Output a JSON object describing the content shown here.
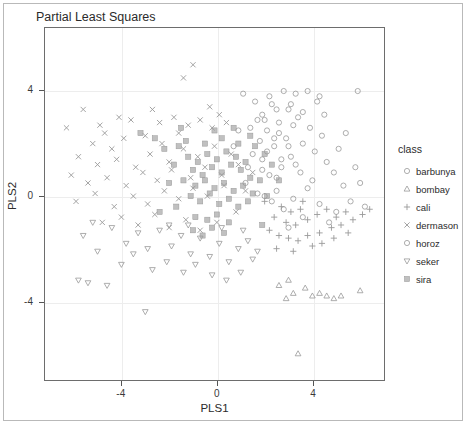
{
  "chart_data": {
    "type": "scatter",
    "title": "Partial Least Squares",
    "xlabel": "PLS1",
    "ylabel": "PLS2",
    "xlim": [
      -7.2,
      7.0
    ],
    "ylim": [
      -7.0,
      6.4
    ],
    "xticks": [
      -4,
      0,
      4
    ],
    "xticklabels": [
      "-4",
      "0",
      "4"
    ],
    "yticks": [
      -4,
      0,
      4
    ],
    "yticklabels": [
      "-4",
      "0",
      "4"
    ],
    "grid": true,
    "grid_color": "#ededed",
    "legend_title": "class",
    "legend_position": "right",
    "marker_color": "#999999",
    "series": [
      {
        "name": "barbunya",
        "marker": "circle",
        "points": [
          [
            3.0,
            3.3
          ],
          [
            3.4,
            3.0
          ],
          [
            2.6,
            2.8
          ],
          [
            3.9,
            2.6
          ],
          [
            4.4,
            2.3
          ],
          [
            2.9,
            2.2
          ],
          [
            3.6,
            2.0
          ],
          [
            4.1,
            1.7
          ],
          [
            2.4,
            1.9
          ],
          [
            3.1,
            1.5
          ],
          [
            4.6,
            1.3
          ],
          [
            2.7,
            1.1
          ],
          [
            3.5,
            0.9
          ],
          [
            4.0,
            0.6
          ],
          [
            2.2,
            0.8
          ],
          [
            3.8,
            0.3
          ],
          [
            4.9,
            0.9
          ],
          [
            5.3,
            0.4
          ],
          [
            2.5,
            0.2
          ],
          [
            3.2,
            -0.1
          ],
          [
            4.3,
            -0.3
          ],
          [
            5.0,
            -0.6
          ],
          [
            2.8,
            -0.5
          ],
          [
            3.6,
            -0.8
          ],
          [
            4.7,
            -1.0
          ],
          [
            5.6,
            -0.2
          ],
          [
            6.0,
            0.5
          ],
          [
            2.1,
            2.5
          ],
          [
            1.9,
            1.4
          ],
          [
            4.2,
            3.6
          ],
          [
            3.3,
            3.9
          ],
          [
            5.1,
            1.8
          ],
          [
            5.8,
            1.1
          ],
          [
            2.3,
            3.5
          ],
          [
            1.7,
            2.9
          ],
          [
            4.5,
            3.1
          ],
          [
            5.4,
            2.4
          ],
          [
            6.2,
            -0.4
          ],
          [
            2.0,
            0.0
          ],
          [
            3.0,
            -1.2
          ]
        ]
      },
      {
        "name": "bombay",
        "marker": "triangle-up",
        "points": [
          [
            2.6,
            -3.4
          ],
          [
            3.2,
            -3.7
          ],
          [
            3.7,
            -3.5
          ],
          [
            4.0,
            -3.8
          ],
          [
            4.3,
            -3.7
          ],
          [
            4.6,
            -3.8
          ],
          [
            5.2,
            -3.8
          ],
          [
            6.0,
            -3.6
          ],
          [
            3.4,
            -6.0
          ],
          [
            2.9,
            -3.9
          ],
          [
            4.9,
            -3.9
          ],
          [
            3.0,
            -3.2
          ]
        ]
      },
      {
        "name": "cali",
        "marker": "plus",
        "points": [
          [
            2.7,
            -0.4
          ],
          [
            3.1,
            -0.6
          ],
          [
            3.5,
            -0.5
          ],
          [
            2.4,
            -0.8
          ],
          [
            2.9,
            -1.0
          ],
          [
            3.3,
            -1.1
          ],
          [
            3.8,
            -0.9
          ],
          [
            4.2,
            -0.7
          ],
          [
            4.6,
            -0.5
          ],
          [
            5.0,
            -0.8
          ],
          [
            5.4,
            -0.6
          ],
          [
            2.2,
            -1.3
          ],
          [
            2.6,
            -1.5
          ],
          [
            3.0,
            -1.6
          ],
          [
            3.4,
            -1.7
          ],
          [
            3.8,
            -1.5
          ],
          [
            4.3,
            -1.4
          ],
          [
            4.8,
            -1.2
          ],
          [
            5.2,
            -1.1
          ],
          [
            5.7,
            -0.9
          ],
          [
            2.0,
            -0.2
          ],
          [
            3.6,
            -0.2
          ],
          [
            4.0,
            -1.9
          ],
          [
            4.4,
            -1.8
          ],
          [
            6.1,
            -0.7
          ],
          [
            2.5,
            -2.0
          ],
          [
            3.2,
            -2.1
          ],
          [
            4.9,
            -1.6
          ],
          [
            5.5,
            -1.4
          ],
          [
            6.4,
            -0.5
          ]
        ]
      },
      {
        "name": "dermason",
        "marker": "x",
        "points": [
          [
            -1.0,
            5.0
          ],
          [
            -1.4,
            4.5
          ],
          [
            -5.6,
            3.3
          ],
          [
            -4.9,
            2.7
          ],
          [
            -4.7,
            2.4
          ],
          [
            -3.6,
            2.9
          ],
          [
            -5.2,
            2.0
          ],
          [
            -4.4,
            1.8
          ],
          [
            -3.0,
            2.3
          ],
          [
            -2.4,
            2.8
          ],
          [
            -1.8,
            3.0
          ],
          [
            -1.2,
            2.7
          ],
          [
            -0.7,
            2.9
          ],
          [
            -0.2,
            2.6
          ],
          [
            0.4,
            2.8
          ],
          [
            -5.8,
            1.5
          ],
          [
            -5.0,
            1.2
          ],
          [
            -4.2,
            1.4
          ],
          [
            -3.4,
            1.1
          ],
          [
            -2.8,
            1.6
          ],
          [
            -2.0,
            1.3
          ],
          [
            -1.4,
            1.8
          ],
          [
            -0.8,
            1.5
          ],
          [
            -0.1,
            1.9
          ],
          [
            0.6,
            1.6
          ],
          [
            -6.1,
            0.8
          ],
          [
            -5.4,
            0.5
          ],
          [
            -4.6,
            0.7
          ],
          [
            -3.8,
            0.4
          ],
          [
            -3.1,
            0.9
          ],
          [
            -2.5,
            0.6
          ],
          [
            -1.9,
            1.0
          ],
          [
            -1.1,
            0.7
          ],
          [
            -0.5,
            1.1
          ],
          [
            0.2,
            0.8
          ],
          [
            -5.9,
            -0.2
          ],
          [
            -5.1,
            0.1
          ],
          [
            -4.3,
            -0.4
          ],
          [
            -3.5,
            0.0
          ],
          [
            -2.9,
            -0.3
          ],
          [
            -2.2,
            0.2
          ],
          [
            -1.6,
            -0.1
          ],
          [
            -1.0,
            0.3
          ],
          [
            -0.4,
            0.0
          ],
          [
            0.3,
            0.4
          ],
          [
            -4.8,
            -1.0
          ],
          [
            -4.0,
            -0.8
          ],
          [
            -3.3,
            -1.1
          ],
          [
            -2.6,
            -0.7
          ],
          [
            -2.0,
            -1.2
          ],
          [
            -1.3,
            -0.9
          ],
          [
            -0.7,
            -1.3
          ],
          [
            0.0,
            -1.0
          ],
          [
            0.8,
            -0.6
          ],
          [
            1.2,
            0.2
          ],
          [
            -2.3,
            2.0
          ],
          [
            -3.9,
            2.2
          ],
          [
            -1.6,
            2.4
          ],
          [
            0.9,
            1.2
          ],
          [
            1.5,
            0.9
          ],
          [
            -6.3,
            2.6
          ],
          [
            -0.3,
            3.4
          ],
          [
            0.1,
            3.1
          ],
          [
            -2.7,
            3.3
          ],
          [
            -4.1,
            3.0
          ]
        ]
      },
      {
        "name": "horoz",
        "marker": "circle",
        "points": [
          [
            1.6,
            3.6
          ],
          [
            2.2,
            3.8
          ],
          [
            2.8,
            4.0
          ],
          [
            1.9,
            3.1
          ],
          [
            2.5,
            3.3
          ],
          [
            3.1,
            3.5
          ],
          [
            1.4,
            2.6
          ],
          [
            2.0,
            2.9
          ],
          [
            2.6,
            2.4
          ],
          [
            3.2,
            2.7
          ],
          [
            1.8,
            2.1
          ],
          [
            2.4,
            2.2
          ],
          [
            3.0,
            1.9
          ],
          [
            1.5,
            1.6
          ],
          [
            2.1,
            1.7
          ],
          [
            2.7,
            1.4
          ],
          [
            3.3,
            1.2
          ],
          [
            1.3,
            1.1
          ],
          [
            1.9,
            1.0
          ],
          [
            2.5,
            0.7
          ],
          [
            3.8,
            4.0
          ],
          [
            4.3,
            3.8
          ],
          [
            1.1,
            3.9
          ],
          [
            0.9,
            2.5
          ],
          [
            3.6,
            3.2
          ],
          [
            5.9,
            4.0
          ],
          [
            1.2,
            0.5
          ],
          [
            1.7,
            0.1
          ],
          [
            2.3,
            -0.2
          ],
          [
            0.7,
            1.9
          ]
        ]
      },
      {
        "name": "seker",
        "marker": "triangle-down",
        "points": [
          [
            -5.6,
            -1.5
          ],
          [
            -5.0,
            -2.1
          ],
          [
            -5.8,
            -3.2
          ],
          [
            -5.4,
            -3.3
          ],
          [
            -4.4,
            -1.2
          ],
          [
            -3.8,
            -1.8
          ],
          [
            -3.3,
            -1.4
          ],
          [
            -2.9,
            -2.0
          ],
          [
            -2.4,
            -1.3
          ],
          [
            -1.9,
            -1.9
          ],
          [
            -1.5,
            -1.5
          ],
          [
            -1.1,
            -2.2
          ],
          [
            -0.7,
            -1.6
          ],
          [
            -0.3,
            -2.3
          ],
          [
            0.1,
            -1.8
          ],
          [
            0.5,
            -2.5
          ],
          [
            0.9,
            -2.0
          ],
          [
            1.3,
            -1.7
          ],
          [
            -4.0,
            -2.6
          ],
          [
            -3.5,
            -2.2
          ],
          [
            -2.7,
            -2.8
          ],
          [
            -2.1,
            -2.5
          ],
          [
            -1.4,
            -2.9
          ],
          [
            -0.9,
            -2.6
          ],
          [
            -0.2,
            -3.0
          ],
          [
            0.4,
            -3.2
          ],
          [
            1.0,
            -2.9
          ],
          [
            1.5,
            -2.4
          ],
          [
            -3.0,
            -4.4
          ],
          [
            -4.6,
            -3.4
          ],
          [
            -2.0,
            -1.1
          ],
          [
            -1.2,
            -1.1
          ],
          [
            0.2,
            -1.2
          ],
          [
            1.1,
            -1.3
          ],
          [
            -5.2,
            -1.0
          ],
          [
            1.7,
            -2.1
          ]
        ]
      },
      {
        "name": "sira",
        "marker": "square-filled",
        "points": [
          [
            -1.2,
            1.5
          ],
          [
            -0.8,
            1.3
          ],
          [
            -0.4,
            1.6
          ],
          [
            0.0,
            1.4
          ],
          [
            0.4,
            1.7
          ],
          [
            0.8,
            1.5
          ],
          [
            1.2,
            1.3
          ],
          [
            -1.0,
            1.0
          ],
          [
            -0.6,
            0.8
          ],
          [
            -0.2,
            1.1
          ],
          [
            0.2,
            0.9
          ],
          [
            0.6,
            1.2
          ],
          [
            1.0,
            1.0
          ],
          [
            1.4,
            0.7
          ],
          [
            -1.4,
            0.6
          ],
          [
            -0.9,
            0.4
          ],
          [
            -0.5,
            0.6
          ],
          [
            -0.1,
            0.3
          ],
          [
            0.3,
            0.5
          ],
          [
            0.7,
            0.2
          ],
          [
            1.1,
            0.4
          ],
          [
            1.5,
            0.1
          ],
          [
            -1.1,
            0.0
          ],
          [
            -0.7,
            -0.2
          ],
          [
            -0.3,
            0.1
          ],
          [
            0.1,
            -0.3
          ],
          [
            0.5,
            -0.1
          ],
          [
            0.9,
            -0.4
          ],
          [
            1.3,
            -0.2
          ],
          [
            -1.6,
            1.9
          ],
          [
            -1.3,
            2.1
          ],
          [
            -0.5,
            2.0
          ],
          [
            0.2,
            2.2
          ],
          [
            0.9,
            2.0
          ],
          [
            1.6,
            1.9
          ],
          [
            -0.9,
            -0.8
          ],
          [
            -0.4,
            -0.9
          ],
          [
            0.0,
            -0.7
          ],
          [
            0.5,
            -1.0
          ],
          [
            -1.0,
            -1.3
          ],
          [
            -0.6,
            -1.5
          ],
          [
            -0.2,
            -1.2
          ],
          [
            0.3,
            -1.4
          ],
          [
            2.0,
            1.6
          ],
          [
            2.3,
            1.2
          ],
          [
            -2.2,
            1.8
          ],
          [
            -1.8,
            1.2
          ],
          [
            -2.0,
            0.5
          ],
          [
            1.8,
            0.6
          ],
          [
            2.1,
            0.0
          ],
          [
            -1.7,
            -0.4
          ],
          [
            1.9,
            -1.1
          ],
          [
            -3.2,
            2.4
          ],
          [
            -2.6,
            2.2
          ],
          [
            2.6,
            0.6
          ],
          [
            -2.4,
            -0.6
          ],
          [
            0.7,
            2.6
          ],
          [
            -0.1,
            2.5
          ],
          [
            1.4,
            2.3
          ],
          [
            -1.5,
            2.6
          ]
        ]
      }
    ]
  },
  "legend": {
    "title": "class",
    "items": [
      {
        "label": "barbunya",
        "glyph": "circle-icon"
      },
      {
        "label": "bombay",
        "glyph": "triangle-up-icon"
      },
      {
        "label": "cali",
        "glyph": "plus-icon"
      },
      {
        "label": "dermason",
        "glyph": "x-mark-icon"
      },
      {
        "label": "horoz",
        "glyph": "circle-icon"
      },
      {
        "label": "seker",
        "glyph": "triangle-down-icon"
      },
      {
        "label": "sira",
        "glyph": "square-filled-icon"
      }
    ]
  }
}
